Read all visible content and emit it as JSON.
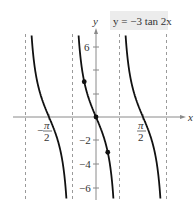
{
  "chart_data": {
    "type": "line",
    "title": "y = −3 tan 2x",
    "xlabel": "x",
    "ylabel": "y",
    "function": "y = -3 tan(2x)",
    "xlim": [
      -3.1416,
      3.1416
    ],
    "ylim": [
      -7,
      7
    ],
    "x_tick_labels": [
      "−π/2",
      "π/2"
    ],
    "x_ticks": [
      -1.5708,
      1.5708
    ],
    "y_ticks": [
      -6,
      -4,
      -2,
      2,
      4,
      6
    ],
    "y_tick_labels": [
      "6",
      "−2",
      "−4",
      "−6"
    ],
    "asymptotes": [
      -2.3562,
      -0.7854,
      0.7854,
      2.3562
    ],
    "asymptote_labels": [
      "x = −3π/4",
      "x = −π/4",
      "x = π/4",
      "x = 3π/4"
    ],
    "points": [
      {
        "x": -0.3927,
        "y": 3
      },
      {
        "x": 0,
        "y": 0
      },
      {
        "x": 0.3927,
        "y": -3
      }
    ],
    "grid": false,
    "series": [
      {
        "name": "branch 1",
        "domain": [
          -2.3562,
          -0.7854
        ]
      },
      {
        "name": "branch 2",
        "domain": [
          -0.7854,
          0.7854
        ]
      },
      {
        "name": "branch 3",
        "domain": [
          0.7854,
          2.3562
        ]
      }
    ]
  },
  "labels": {
    "title": "y = −3 tan 2x",
    "x_axis": "x",
    "y_axis": "y",
    "neg_pi": "π",
    "neg_minus": "−",
    "two_a": "2",
    "pos_pi": "π",
    "two_b": "2",
    "y6": "6",
    "yn2": "−2",
    "yn4": "−4",
    "yn6": "−6"
  },
  "colors": {
    "curve": "#111111",
    "axis": "#8a8a8a",
    "asymptote": "#9a9a9a",
    "title_bg": "#ececec"
  }
}
